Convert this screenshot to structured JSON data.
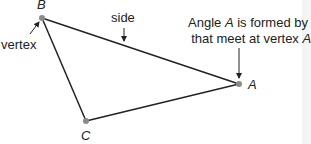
{
  "diagram": {
    "vertices": [
      {
        "name": "B",
        "x": 42,
        "y": 18
      },
      {
        "name": "A",
        "x": 239,
        "y": 84
      },
      {
        "name": "C",
        "x": 86,
        "y": 121
      }
    ],
    "labels": {
      "vertex_B": "B",
      "vertex_A": "A",
      "vertex_C": "C",
      "side": "side",
      "vertex": "vertex"
    },
    "note": {
      "line1_pre": "Angle ",
      "line1_var": "A",
      "line1_post": " is formed by sides",
      "line2_pre": "that meet at vertex ",
      "line2_var": "A",
      "line2_post": "."
    },
    "colors": {
      "line": "#222222",
      "vertex_dot": "#8a8a8a"
    }
  }
}
